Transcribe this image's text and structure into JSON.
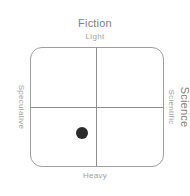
{
  "diagram": {
    "type": "quadrant",
    "vertical_axis_title": "Fiction",
    "horizontal_axis_title": "Science",
    "axes": {
      "top": "Light",
      "bottom": "Heavy",
      "left": "Speculative",
      "right": "Scientific"
    },
    "point": {
      "x_percent": 39,
      "y_percent": 72,
      "color": "#2b2b2b"
    },
    "colors": {
      "border": "#9e9e9e",
      "divider": "#8e8e8e",
      "title_text": "#7f7f7f",
      "axis_text": "#a0a0a0"
    }
  }
}
